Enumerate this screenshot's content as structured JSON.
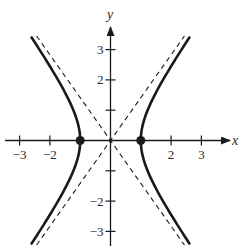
{
  "chart_data": {
    "type": "line",
    "title": "",
    "xlabel": "x",
    "ylabel": "y",
    "xlim": [
      -3.6,
      3.8
    ],
    "ylim": [
      -3.6,
      3.8
    ],
    "grid": false,
    "x_ticks": [
      -3,
      -2,
      2,
      3
    ],
    "x_tick_labels": [
      "−3",
      "−2",
      "2",
      "3"
    ],
    "y_ticks": [
      3,
      2,
      1,
      -1,
      -2,
      -3
    ],
    "y_tick_labels": [
      "3",
      "2",
      "",
      "",
      "−2",
      "−3"
    ],
    "series": [
      {
        "name": "hyperbola",
        "equation": "x^2 - y^2/2 = 1",
        "style": "solid",
        "branches": [
          "left",
          "right"
        ]
      },
      {
        "name": "asymptote 1",
        "equation": "y = sqrt(2) x",
        "style": "dashed"
      },
      {
        "name": "asymptote 2",
        "equation": "y = -sqrt(2) x",
        "style": "dashed"
      }
    ],
    "points": [
      {
        "label": "left vertex",
        "x": -1,
        "y": 0
      },
      {
        "label": "right vertex",
        "x": 1,
        "y": 0
      }
    ]
  },
  "axes": {
    "x_label": "x",
    "y_label": "y"
  },
  "colors": {
    "ink": "#1a1a1a"
  }
}
